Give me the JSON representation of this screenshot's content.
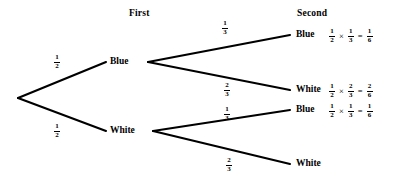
{
  "diagram": {
    "type": "probability-tree",
    "headers": {
      "first": "First",
      "second": "Second"
    },
    "colors": {
      "line": "#000000",
      "text": "#000000",
      "background": "#ffffff"
    },
    "first_level": [
      {
        "id": "first-blue",
        "label": "Blue",
        "probability": {
          "num": "1",
          "den": "2"
        }
      },
      {
        "id": "first-white",
        "label": "White",
        "probability": {
          "num": "1",
          "den": "2"
        }
      }
    ],
    "second_level": [
      {
        "id": "second-blue-blue",
        "label": "Blue",
        "probability": {
          "num": "1",
          "den": "3"
        },
        "equation": {
          "first": {
            "num": "1",
            "den": "2"
          },
          "times": "×",
          "second": {
            "num": "1",
            "den": "3"
          },
          "equals": "=",
          "result": {
            "num": "1",
            "den": "6"
          }
        }
      },
      {
        "id": "second-blue-white",
        "label": "White",
        "probability": {
          "num": "2",
          "den": "3"
        },
        "equation": {
          "first": {
            "num": "1",
            "den": "2"
          },
          "times": "×",
          "second": {
            "num": "2",
            "den": "3"
          },
          "equals": "=",
          "result": {
            "num": "2",
            "den": "6"
          }
        }
      },
      {
        "id": "second-white-blue",
        "label": "Blue",
        "probability": {
          "num": "1",
          "den": "3"
        },
        "equation": {
          "first": {
            "num": "1",
            "den": "2"
          },
          "times": "×",
          "second": {
            "num": "1",
            "den": "3"
          },
          "equals": "=",
          "result": {
            "num": "1",
            "den": "6"
          }
        }
      },
      {
        "id": "second-white-white",
        "label": "White",
        "probability": {
          "num": "2",
          "den": "3"
        },
        "equation": null
      }
    ]
  }
}
